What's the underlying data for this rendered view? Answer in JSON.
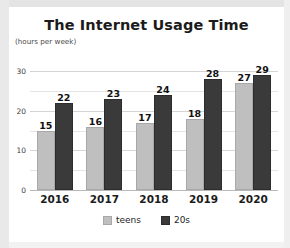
{
  "chart_data": {
    "type": "bar",
    "title": "The Internet Usage Time",
    "subtitle": "(hours per week)",
    "xlabel": "",
    "ylabel": "",
    "ylim": [
      0,
      30
    ],
    "grid": true,
    "legend_position": "bottom",
    "categories": [
      "2016",
      "2017",
      "2018",
      "2019",
      "2020"
    ],
    "yticks": [
      0,
      10,
      20,
      30
    ],
    "ytick_labels": [
      "0",
      "10",
      "20",
      "30"
    ],
    "minor_gridlines": [
      5,
      15,
      25
    ],
    "series": [
      {
        "name": "teens",
        "color": "#bfbfbf",
        "values": [
          15,
          16,
          17,
          18,
          27
        ]
      },
      {
        "name": "20s",
        "color": "#3a3a3a",
        "values": [
          22,
          23,
          24,
          28,
          29
        ]
      }
    ]
  }
}
